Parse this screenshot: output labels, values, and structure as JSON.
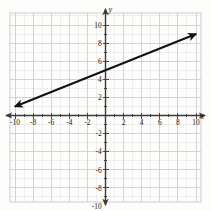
{
  "chart_data": {
    "type": "line",
    "title": "",
    "subtitle": "",
    "xlabel": "x",
    "ylabel": "y",
    "xlim": [
      -10,
      10
    ],
    "ylim": [
      -10,
      10
    ],
    "x_ticks": [
      -10,
      -8,
      -6,
      -4,
      -2,
      2,
      4,
      6,
      8,
      10
    ],
    "y_ticks": [
      -10,
      -8,
      -6,
      -4,
      -2,
      2,
      4,
      6,
      8,
      10
    ],
    "x_tick_labels": [
      "-10",
      "-8",
      "-6",
      "-4",
      "-2",
      "2",
      "4",
      "6",
      "8",
      "10"
    ],
    "y_tick_labels": [
      "-10",
      "-8",
      "-6",
      "-4",
      "-2",
      "2",
      "4",
      "6",
      "8",
      "10"
    ],
    "minor_grid_step": 1,
    "major_grid_step": 2,
    "grid": true,
    "legend": false,
    "legend_position": "none",
    "series": [
      {
        "name": "line",
        "equation": "y = 0.4x + 5",
        "slope": 0.4,
        "intercept": 5,
        "color": "#111111",
        "arrows": "both",
        "x": [
          -10,
          10
        ],
        "values": [
          1,
          9
        ],
        "endpoints": [
          {
            "x": -10,
            "y": 1
          },
          {
            "x": 10,
            "y": 9
          }
        ],
        "notable_points": [
          {
            "x": 0,
            "y": 5,
            "label": "y-intercept"
          },
          {
            "x": -12.5,
            "y": 0,
            "label": "x-intercept"
          }
        ]
      }
    ],
    "axis_color": "#3a3a3a",
    "grid_color_minor": "#e2e2e4",
    "grid_color_major": "#c9c9cc",
    "background": "#fdfdfc"
  },
  "axes": {
    "x_axis_name": "x",
    "y_axis_name": "y"
  }
}
